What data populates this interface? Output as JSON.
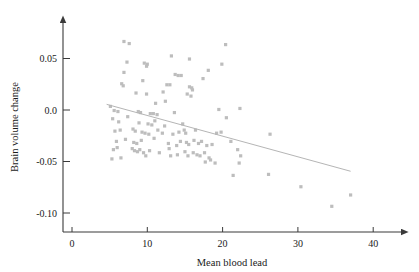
{
  "chart_data": {
    "type": "scatter",
    "title": "",
    "xlabel": "Mean blood lead",
    "ylabel": "Brain volume change",
    "xlim": [
      0,
      42
    ],
    "ylim": [
      -0.115,
      0.075
    ],
    "grid": false,
    "legend": null,
    "xticks": [
      0,
      10,
      20,
      30,
      40
    ],
    "xtick_labels": [
      "0",
      "10",
      "20",
      "30",
      "40"
    ],
    "yticks": [
      0.05,
      0.0,
      -0.05,
      -0.1
    ],
    "ytick_labels": [
      "0.05",
      "0.0",
      "-0.05",
      "-0.10"
    ],
    "marker_color": "#bdbdbd",
    "marker_shape": "square",
    "fit_line": {
      "color": "#b5b5b5",
      "x_start": 4.6,
      "y_start": 0.0055,
      "x_end": 37.0,
      "y_end": -0.0595
    },
    "points": [
      [
        6.9,
        0.0665
      ],
      [
        7.6,
        0.0645
      ],
      [
        20.4,
        0.0635
      ],
      [
        13.2,
        0.0525
      ],
      [
        15.6,
        0.0495
      ],
      [
        7.3,
        0.0465
      ],
      [
        9.6,
        0.0455
      ],
      [
        10.0,
        0.0445
      ],
      [
        9.9,
        0.0425
      ],
      [
        19.9,
        0.0445
      ],
      [
        18.1,
        0.0385
      ],
      [
        6.9,
        0.0365
      ],
      [
        13.7,
        0.0345
      ],
      [
        14.1,
        0.0335
      ],
      [
        14.5,
        0.0335
      ],
      [
        17.4,
        0.0305
      ],
      [
        6.6,
        0.0255
      ],
      [
        9.4,
        0.0285
      ],
      [
        12.6,
        0.0245
      ],
      [
        13.0,
        0.0245
      ],
      [
        6.8,
        0.0235
      ],
      [
        15.6,
        0.0225
      ],
      [
        15.9,
        0.0215
      ],
      [
        16.0,
        0.0195
      ],
      [
        12.1,
        0.0175
      ],
      [
        15.3,
        0.0155
      ],
      [
        8.5,
        0.0165
      ],
      [
        9.9,
        0.0155
      ],
      [
        15.8,
        0.0135
      ],
      [
        12.4,
        0.0085
      ],
      [
        11.1,
        0.0065
      ],
      [
        5.1,
        0.0035
      ],
      [
        5.6,
        -0.0005
      ],
      [
        6.1,
        -0.0015
      ],
      [
        8.8,
        -0.0015
      ],
      [
        9.1,
        -0.0025
      ],
      [
        10.4,
        -0.0035
      ],
      [
        10.8,
        -0.0035
      ],
      [
        11.3,
        -0.0045
      ],
      [
        13.6,
        -0.0025
      ],
      [
        19.5,
        0.0005
      ],
      [
        22.3,
        0.0015
      ],
      [
        5.4,
        -0.0085
      ],
      [
        7.4,
        -0.0065
      ],
      [
        6.2,
        -0.0115
      ],
      [
        8.9,
        -0.0125
      ],
      [
        10.1,
        -0.0135
      ],
      [
        10.6,
        -0.0145
      ],
      [
        11.0,
        -0.0105
      ],
      [
        12.3,
        -0.0155
      ],
      [
        14.7,
        -0.0135
      ],
      [
        20.5,
        -0.0075
      ],
      [
        5.7,
        -0.0205
      ],
      [
        6.4,
        -0.0195
      ],
      [
        8.1,
        -0.0185
      ],
      [
        8.4,
        -0.0205
      ],
      [
        9.3,
        -0.0215
      ],
      [
        9.7,
        -0.0225
      ],
      [
        10.2,
        -0.0235
      ],
      [
        11.4,
        -0.0195
      ],
      [
        12.0,
        -0.0225
      ],
      [
        13.4,
        -0.0235
      ],
      [
        14.2,
        -0.0215
      ],
      [
        14.9,
        -0.0195
      ],
      [
        15.1,
        -0.0225
      ],
      [
        16.4,
        -0.0195
      ],
      [
        19.2,
        -0.0225
      ],
      [
        19.8,
        -0.0215
      ],
      [
        26.3,
        -0.0235
      ],
      [
        5.9,
        -0.0305
      ],
      [
        7.1,
        -0.0285
      ],
      [
        8.2,
        -0.0315
      ],
      [
        8.6,
        -0.0325
      ],
      [
        9.2,
        -0.0295
      ],
      [
        10.9,
        -0.0275
      ],
      [
        12.8,
        -0.0325
      ],
      [
        13.9,
        -0.0345
      ],
      [
        14.4,
        -0.0305
      ],
      [
        15.2,
        -0.0315
      ],
      [
        15.5,
        -0.0335
      ],
      [
        16.2,
        -0.0295
      ],
      [
        16.8,
        -0.0325
      ],
      [
        17.2,
        -0.0305
      ],
      [
        17.9,
        -0.0345
      ],
      [
        18.6,
        -0.0335
      ],
      [
        21.1,
        -0.0305
      ],
      [
        22.0,
        -0.0385
      ],
      [
        5.5,
        -0.0385
      ],
      [
        6.0,
        -0.0365
      ],
      [
        8.0,
        -0.0375
      ],
      [
        8.3,
        -0.0395
      ],
      [
        8.7,
        -0.0405
      ],
      [
        9.0,
        -0.0385
      ],
      [
        9.5,
        -0.0415
      ],
      [
        10.3,
        -0.0395
      ],
      [
        11.6,
        -0.0415
      ],
      [
        12.9,
        -0.0375
      ],
      [
        13.1,
        -0.0445
      ],
      [
        14.0,
        -0.0435
      ],
      [
        15.0,
        -0.0405
      ],
      [
        15.4,
        -0.0445
      ],
      [
        16.1,
        -0.0415
      ],
      [
        16.6,
        -0.0435
      ],
      [
        17.0,
        -0.0445
      ],
      [
        17.6,
        -0.0415
      ],
      [
        18.2,
        -0.0465
      ],
      [
        22.4,
        -0.0445
      ],
      [
        5.3,
        -0.0475
      ],
      [
        6.5,
        -0.0465
      ],
      [
        9.8,
        -0.0445
      ],
      [
        17.7,
        -0.0505
      ],
      [
        18.4,
        -0.0485
      ],
      [
        19.0,
        -0.0515
      ],
      [
        22.2,
        -0.0515
      ],
      [
        21.4,
        -0.0635
      ],
      [
        26.1,
        -0.0625
      ],
      [
        30.4,
        -0.0745
      ],
      [
        34.5,
        -0.0935
      ],
      [
        37.0,
        -0.0825
      ]
    ]
  }
}
